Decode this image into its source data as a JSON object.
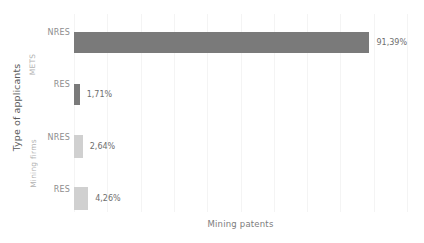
{
  "chart_data": {
    "type": "bar",
    "orientation": "horizontal",
    "title": "",
    "xlabel": "Mining patents",
    "ylabel": "Type of applicants",
    "xlim": [
      0,
      100
    ],
    "grid": true,
    "legend": "none",
    "groups": [
      {
        "name": "METS",
        "color": "#7a7a7a",
        "categories": [
          "NRES",
          "RES"
        ],
        "values": [
          91.39,
          1.71
        ],
        "labels": [
          "91,39%",
          "1,71%"
        ]
      },
      {
        "name": "Mining firms",
        "color": "#d0d0d0",
        "categories": [
          "NRES",
          "RES"
        ],
        "values": [
          2.64,
          4.26
        ],
        "labels": [
          "2,64%",
          "4,26%"
        ]
      }
    ],
    "categories": [
      "NRES",
      "RES",
      "NRES",
      "RES"
    ],
    "values": [
      91.39,
      1.71,
      2.64,
      4.26
    ],
    "value_labels": [
      "91,39%",
      "1,71%",
      "2,64%",
      "4,26%"
    ],
    "bar_colors": [
      "#7a7a7a",
      "#7a7a7a",
      "#d0d0d0",
      "#d0d0d0"
    ],
    "gridline_count": 11,
    "colors": {
      "background": "#ffffff",
      "gridline": "#f4f4f4",
      "dark_bar": "#7a7a7a",
      "light_bar": "#d0d0d0",
      "axis_title": "#5a5a5a",
      "tick_label": "#8d8d8d",
      "group_label": "#b2b2b2",
      "value_label": "#6e6e6e"
    }
  }
}
